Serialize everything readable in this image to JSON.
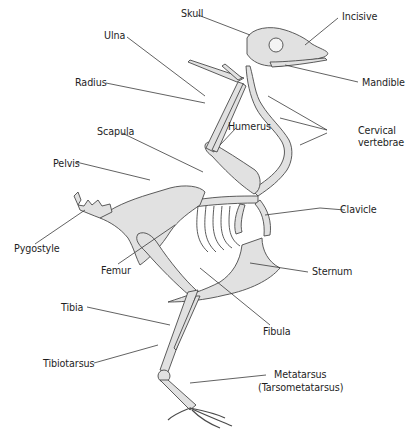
{
  "diagram": {
    "colors": {
      "bone_fill": "#e1e1e1",
      "bone_stroke": "#4a4a4a",
      "leader_line": "#3a3a3a",
      "text": "#1e1e1e",
      "background": "#ffffff"
    },
    "labels": {
      "skull": "Skull",
      "incisive": "Incisive",
      "ulna": "Ulna",
      "radius": "Radius",
      "mandible": "Mandible",
      "humerus": "Humerus",
      "scapula": "Scapula",
      "cervical_1": "Cervical",
      "cervical_2": "vertebrae",
      "pelvis": "Pelvis",
      "clavicle": "Clavicle",
      "pygostyle": "Pygostyle",
      "femur": "Femur",
      "sternum": "Sternum",
      "tibia": "Tibia",
      "fibula": "Fibula",
      "tibiotarsus": "Tibiotarsus",
      "metatarsus_1": "Metatarsus",
      "metatarsus_2": "(Tarsometatarsus)"
    }
  }
}
